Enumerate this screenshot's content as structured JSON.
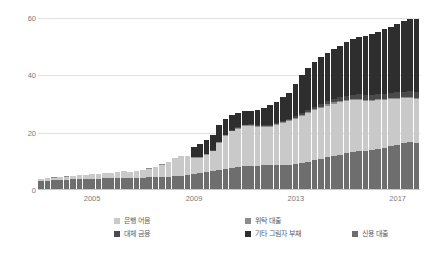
{
  "chart_data": {
    "type": "bar",
    "stacked": true,
    "title": "",
    "xlabel": "",
    "ylabel": "",
    "ylim": [
      0,
      62
    ],
    "yticks": [
      0,
      20,
      40,
      60
    ],
    "ytick_labels": [
      "0",
      "20",
      "40",
      "60"
    ],
    "grid": true,
    "legend_position": "bottom",
    "xtick_labels": [
      "2005",
      "2009",
      "2013",
      "2017"
    ],
    "xtick_indices": [
      8,
      24,
      40,
      56
    ],
    "categories": [
      "2003Q1",
      "2003Q2",
      "2003Q3",
      "2003Q4",
      "2004Q1",
      "2004Q2",
      "2004Q3",
      "2004Q4",
      "2005Q1",
      "2005Q2",
      "2005Q3",
      "2005Q4",
      "2006Q1",
      "2006Q2",
      "2006Q3",
      "2006Q4",
      "2007Q1",
      "2007Q2",
      "2007Q3",
      "2007Q4",
      "2008Q1",
      "2008Q2",
      "2008Q3",
      "2008Q4",
      "2009Q1",
      "2009Q2",
      "2009Q3",
      "2009Q4",
      "2010Q1",
      "2010Q2",
      "2010Q3",
      "2010Q4",
      "2011Q1",
      "2011Q2",
      "2011Q3",
      "2011Q4",
      "2012Q1",
      "2012Q2",
      "2012Q3",
      "2012Q4",
      "2013Q1",
      "2013Q2",
      "2013Q3",
      "2013Q4",
      "2014Q1",
      "2014Q2",
      "2014Q3",
      "2014Q4",
      "2015Q1",
      "2015Q2",
      "2015Q3",
      "2015Q4",
      "2016Q1",
      "2016Q2",
      "2016Q3",
      "2016Q4",
      "2017Q1",
      "2017Q2",
      "2017Q3",
      "2017Q4"
    ],
    "series": [
      {
        "name": "신용 대출",
        "color": "#6e6e6e",
        "values": [
          3.2,
          3.3,
          3.4,
          3.5,
          3.6,
          3.7,
          3.8,
          3.9,
          4.0,
          4.0,
          4.1,
          4.2,
          4.3,
          4.3,
          4.2,
          4.3,
          4.3,
          4.4,
          4.4,
          4.5,
          4.6,
          4.8,
          5.0,
          5.2,
          5.5,
          5.8,
          6.2,
          6.5,
          6.8,
          7.2,
          7.6,
          7.9,
          8.2,
          8.4,
          8.5,
          8.6,
          8.6,
          8.6,
          8.7,
          8.8,
          9.0,
          9.4,
          9.8,
          10.3,
          10.8,
          11.4,
          11.9,
          12.3,
          12.8,
          13.2,
          13.5,
          13.6,
          13.9,
          14.3,
          14.8,
          15.3,
          15.8,
          16.3,
          16.7,
          16.5
        ]
      },
      {
        "name": "은행 어음",
        "color": "#c9c9c9",
        "values": [
          0.7,
          0.8,
          0.9,
          1.0,
          1.1,
          1.2,
          1.3,
          1.4,
          1.5,
          1.6,
          1.7,
          1.8,
          2.0,
          2.2,
          2.1,
          2.3,
          2.6,
          3.0,
          3.6,
          4.3,
          5.2,
          6.2,
          6.9,
          6.6,
          5.7,
          5.5,
          6.0,
          7.0,
          9.5,
          11.5,
          12.8,
          13.5,
          14.0,
          13.9,
          13.6,
          13.4,
          13.5,
          14.0,
          14.6,
          15.2,
          15.8,
          16.4,
          17.0,
          17.4,
          17.8,
          18.0,
          18.2,
          18.3,
          18.2,
          18.0,
          17.8,
          17.5,
          17.2,
          16.9,
          16.6,
          16.3,
          16.0,
          15.7,
          15.3,
          15.2
        ]
      },
      {
        "name": "위탁 대출",
        "color": "#8c8c8c",
        "values": [
          0.1,
          0.1,
          0.1,
          0.1,
          0.1,
          0.1,
          0.1,
          0.1,
          0.1,
          0.1,
          0.1,
          0.1,
          0.1,
          0.1,
          0.1,
          0.1,
          0.1,
          0.1,
          0.1,
          0.1,
          0.1,
          0.1,
          0.1,
          0.1,
          0.2,
          0.2,
          0.2,
          0.2,
          0.3,
          0.3,
          0.3,
          0.3,
          0.3,
          0.3,
          0.3,
          0.3,
          0.3,
          0.3,
          0.3,
          0.3,
          0.4,
          0.4,
          0.4,
          0.4,
          0.4,
          0.4,
          0.4,
          0.4,
          0.4,
          0.4,
          0.4,
          0.4,
          0.4,
          0.4,
          0.4,
          0.4,
          0.4,
          0.4,
          0.4,
          0.4
        ]
      },
      {
        "name": "대체 금융",
        "color": "#4a4a4a",
        "values": [
          0.0,
          0.0,
          0.0,
          0.0,
          0.0,
          0.0,
          0.0,
          0.0,
          0.0,
          0.0,
          0.0,
          0.0,
          0.0,
          0.0,
          0.0,
          0.0,
          0.0,
          0.0,
          0.0,
          0.0,
          0.0,
          0.0,
          0.0,
          0.0,
          0.1,
          0.1,
          0.1,
          0.1,
          0.2,
          0.2,
          0.2,
          0.2,
          0.3,
          0.3,
          0.3,
          0.3,
          0.4,
          0.4,
          0.5,
          0.5,
          0.6,
          0.7,
          0.8,
          0.9,
          1.0,
          1.1,
          1.2,
          1.3,
          1.4,
          1.5,
          1.6,
          1.6,
          1.7,
          1.7,
          1.8,
          1.8,
          1.9,
          1.9,
          2.0,
          2.0
        ]
      },
      {
        "name": "기타 그림자 부채",
        "color": "#2e2e2e",
        "values": [
          0.0,
          0.0,
          0.0,
          0.0,
          0.0,
          0.0,
          0.0,
          0.0,
          0.0,
          0.0,
          0.0,
          0.0,
          0.0,
          0.0,
          0.0,
          0.0,
          0.0,
          0.0,
          0.0,
          0.0,
          0.0,
          0.0,
          0.0,
          0.0,
          3.6,
          4.4,
          4.9,
          5.4,
          5.7,
          5.6,
          5.3,
          4.9,
          4.7,
          4.8,
          5.2,
          5.9,
          6.8,
          7.5,
          8.2,
          9.1,
          11.0,
          13.0,
          14.6,
          15.5,
          16.2,
          16.8,
          17.4,
          18.0,
          18.7,
          19.4,
          20.0,
          20.4,
          21.0,
          21.7,
          22.4,
          23.1,
          23.8,
          24.5,
          25.1,
          25.4
        ]
      }
    ],
    "totals": [
      4.0,
      4.2,
      4.4,
      4.6,
      4.8,
      5.0,
      5.2,
      5.4,
      5.6,
      5.7,
      5.9,
      6.1,
      6.4,
      6.6,
      6.4,
      6.7,
      7.0,
      7.5,
      8.1,
      8.9,
      9.9,
      11.1,
      12.0,
      11.9,
      15.1,
      16.0,
      17.4,
      19.2,
      22.5,
      24.8,
      26.2,
      26.8,
      27.5,
      27.7,
      27.9,
      28.5,
      29.6,
      30.8,
      32.3,
      33.9,
      36.8,
      39.9,
      42.6,
      44.5,
      46.2,
      47.7,
      49.1,
      50.3,
      51.5,
      52.5,
      53.3,
      53.5,
      54.2,
      55.0,
      56.0,
      56.9,
      57.9,
      58.8,
      59.5,
      59.5
    ]
  }
}
